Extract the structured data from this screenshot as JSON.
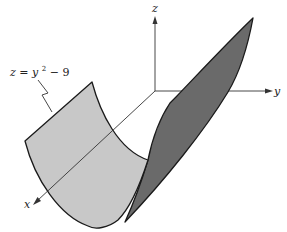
{
  "figure": {
    "equation_label": {
      "z": "z",
      "equals": " = ",
      "y": "y",
      "exponent": "2",
      "rest": " − 9"
    },
    "axes": {
      "x_label": "x",
      "y_label": "y",
      "z_label": "z"
    },
    "colors": {
      "light_face": "#c8c8c8",
      "dark_face": "#6a6a6a",
      "outline": "#1a1a1a",
      "axis": "#333333",
      "background": "#ffffff"
    },
    "surface_name": "parabolic cylinder"
  }
}
